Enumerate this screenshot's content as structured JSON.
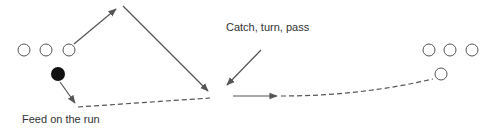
{
  "diagram": {
    "labels": {
      "catch_turn_pass": "Catch, turn, pass",
      "feed_on_the_run": "Feed on the run"
    },
    "colors": {
      "line": "#555555",
      "player_outline": "#555555",
      "ball_carrier_fill": "#111111",
      "text": "#333333"
    },
    "players_left": [
      {
        "x": 24,
        "y": 50
      },
      {
        "x": 46,
        "y": 50
      },
      {
        "x": 69,
        "y": 50
      }
    ],
    "ball_carrier": {
      "x": 58,
      "y": 74
    },
    "players_right": [
      {
        "x": 429,
        "y": 50
      },
      {
        "x": 450,
        "y": 50
      },
      {
        "x": 472,
        "y": 50
      }
    ],
    "receiver_right": {
      "x": 441,
      "y": 74
    }
  }
}
